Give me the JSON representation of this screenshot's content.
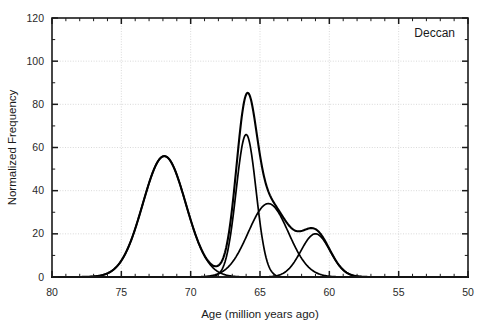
{
  "chart_data": {
    "type": "line",
    "title": "",
    "panel_label": "Deccan",
    "xlabel": "Age (million years ago)",
    "ylabel": "Normalized Frequency",
    "xlim": [
      80,
      50
    ],
    "ylim": [
      0,
      120
    ],
    "x_reversed": true,
    "grid": true,
    "legend_position": "none",
    "x_ticks": [
      80,
      75,
      70,
      65,
      60,
      55,
      50
    ],
    "x_tick_labels": [
      "80",
      "75",
      "70",
      "65",
      "60",
      "55",
      "50"
    ],
    "x_minor_step": 1,
    "y_ticks": [
      0,
      20,
      40,
      60,
      80,
      100,
      120
    ],
    "y_tick_labels": [
      "0",
      "20",
      "40",
      "60",
      "80",
      "100",
      "120"
    ],
    "y_minor_step": 10,
    "components": [
      {
        "name": "component-1",
        "center": 71.9,
        "amplitude": 56,
        "sigma": 1.55
      },
      {
        "name": "component-2",
        "center": 66.0,
        "amplitude": 66,
        "sigma": 0.72
      },
      {
        "name": "component-3",
        "center": 64.4,
        "amplitude": 34,
        "sigma": 1.45
      },
      {
        "name": "component-4",
        "center": 61.0,
        "amplitude": 20,
        "sigma": 1.05
      }
    ],
    "envelope": {
      "name": "summed-envelope",
      "peaks": [
        {
          "age": 71.9,
          "value": 58
        },
        {
          "age": 66.0,
          "value": 96
        },
        {
          "age": 64.3,
          "value": 36
        },
        {
          "age": 61.0,
          "value": 22
        }
      ],
      "notch": {
        "age": 70.6,
        "value": 48
      },
      "onset_age": 75.5,
      "end_age": 58.5
    }
  }
}
